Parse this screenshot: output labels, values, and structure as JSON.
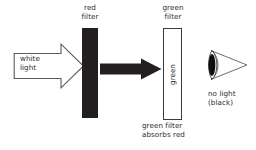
{
  "diagram": {
    "title": "green filter absorbs red",
    "canvas": {
      "width": 256,
      "height": 150,
      "background": "#ffffff"
    },
    "colors": {
      "ink": "#2b2b2b",
      "red_filter_fill": "#231f20",
      "green_filter_fill": "#ffffff",
      "green_filter_stroke": "#3a3a3a",
      "black_arrow": "#231f20",
      "white_arrow_fill": "#ffffff",
      "white_arrow_stroke": "#555555",
      "pupil": "#0d0d0d"
    },
    "source": {
      "label": "white\nlight",
      "arrow_icon": "right-arrow-outline-icon"
    },
    "red_filter": {
      "label": "red\nfilter",
      "shape_icon": "filter-bar-solid-icon"
    },
    "beam": {
      "arrow_icon": "right-arrow-solid-icon"
    },
    "green_filter": {
      "label": "green\nfilter",
      "inner_text": "green",
      "inner_text_marker": "•",
      "caption": "green filter\nabsorbs red",
      "shape_icon": "filter-bar-outline-icon"
    },
    "observer": {
      "label": "no light\n(black)",
      "eye_icon": "eye-icon"
    }
  }
}
